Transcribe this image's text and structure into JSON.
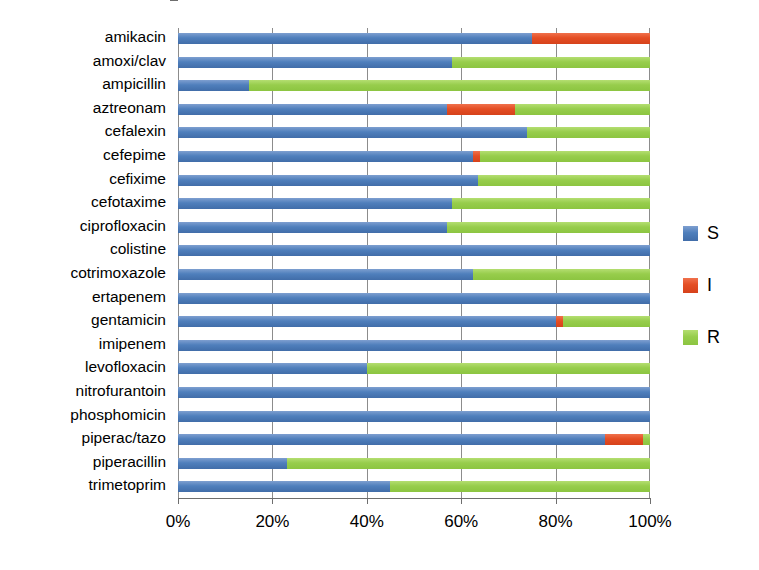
{
  "chart_data": {
    "type": "bar",
    "subtype": "stacked-horizontal-100percent",
    "title": "",
    "xlabel": "",
    "ylabel": "",
    "xlim": [
      0,
      100
    ],
    "xticks": [
      "0%",
      "20%",
      "40%",
      "60%",
      "80%",
      "100%"
    ],
    "xtick_values": [
      0,
      20,
      40,
      60,
      80,
      100
    ],
    "grid": true,
    "legend_position": "right",
    "categories": [
      "amikacin",
      "amoxi/clav",
      "ampicillin",
      "aztreonam",
      "cefalexin",
      "cefepime",
      "cefixime",
      "cefotaxime",
      "ciprofloxacin",
      "colistine",
      "cotrimoxazole",
      "ertapenem",
      "gentamicin",
      "imipenem",
      "levofloxacin",
      "nitrofurantoin",
      "phosphomicin",
      "piperac/tazo",
      "piperacillin",
      "trimetoprim"
    ],
    "series": [
      {
        "name": "S",
        "color": "#4f7fbc",
        "values": [
          75,
          58,
          15,
          57,
          74,
          62.5,
          63.5,
          58,
          57,
          100,
          62.5,
          100,
          80,
          100,
          40,
          100,
          100,
          90.5,
          23,
          45
        ]
      },
      {
        "name": "I",
        "color": "#e44e24",
        "values": [
          25,
          0,
          0,
          14.5,
          0,
          1.5,
          0,
          0,
          0,
          0,
          0,
          0,
          1.5,
          0,
          0,
          0,
          0,
          8,
          0,
          0
        ]
      },
      {
        "name": "R",
        "color": "#97cd4c",
        "values": [
          0,
          42,
          85,
          28.5,
          26,
          36,
          36.5,
          42,
          43,
          0,
          37.5,
          0,
          18.5,
          0,
          60,
          0,
          0,
          1.5,
          77,
          55
        ]
      }
    ]
  },
  "legend": {
    "items": [
      {
        "label": "S",
        "color": "#4f7fbc"
      },
      {
        "label": "I",
        "color": "#e44e24"
      },
      {
        "label": "R",
        "color": "#97cd4c"
      }
    ]
  }
}
